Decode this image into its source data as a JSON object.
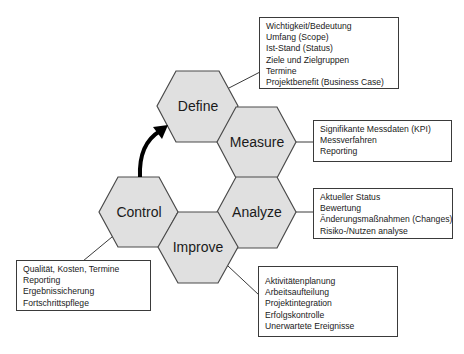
{
  "diagram": {
    "phases": [
      {
        "id": "define",
        "label": "Define"
      },
      {
        "id": "measure",
        "label": "Measure"
      },
      {
        "id": "analyze",
        "label": "Analyze"
      },
      {
        "id": "improve",
        "label": "Improve"
      },
      {
        "id": "control",
        "label": "Control"
      }
    ],
    "boxes": {
      "define": [
        "Wichtigkeit/Bedeutung",
        "Umfang (Scope)",
        "Ist-Stand (Status)",
        "Ziele und Zielgruppen",
        "Termine",
        "Projektbenefit (Business Case)"
      ],
      "measure": [
        "Signifikante Messdaten (KPI)",
        "Messverfahren",
        "Reporting"
      ],
      "analyze": [
        "Aktueller Status",
        "Bewertung",
        "Änderungsmaßnahmen (Changes)",
        "Risiko-/Nutzen analyse"
      ],
      "improve": [
        "Aktivitätenplanung",
        "Arbeitsaufteilung",
        "Projektintegration",
        "Erfolgskontrolle",
        "Unerwartete Ereignisse"
      ],
      "control": [
        "Qualität, Kosten, Termine",
        "Reporting",
        "Ergebnissicherung",
        "Fortschrittspflege"
      ]
    },
    "colors": {
      "hex_fill": "#e0e0e0",
      "hex_stroke": "#4a4a4a",
      "arrow": "#000000"
    }
  }
}
